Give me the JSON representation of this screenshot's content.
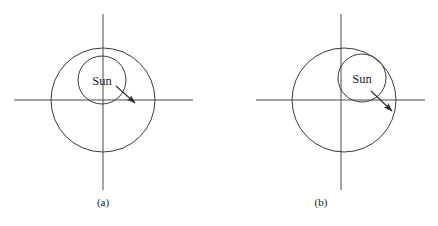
{
  "figure": {
    "background_color": "#ffffff",
    "stroke_color": "#3a3a3a",
    "text_color": "#1a1a1a",
    "panels": [
      {
        "id": "a",
        "caption": "(a)",
        "sun_label": "Sun",
        "axes": {
          "origin_x": 103,
          "origin_y": 100,
          "h_axis_x1": 14,
          "h_axis_x2": 193,
          "v_axis_y1": 14,
          "v_axis_y2": 190
        },
        "orbit_circle": {
          "cx": 103,
          "cy": 100,
          "r": 52
        },
        "sun_circle": {
          "cx": 102,
          "cy": 80,
          "r": 24
        },
        "arrow": {
          "x1": 116,
          "y1": 86,
          "x2": 137,
          "y2": 105
        }
      },
      {
        "id": "b",
        "caption": "(b)",
        "sun_label": "Sun",
        "axes": {
          "origin_x": 341,
          "origin_y": 100,
          "h_axis_x1": 256,
          "h_axis_x2": 425,
          "v_axis_y1": 14,
          "v_axis_y2": 190
        },
        "orbit_circle": {
          "cx": 344,
          "cy": 100,
          "r": 52
        },
        "sun_circle": {
          "cx": 362,
          "cy": 78,
          "r": 24
        },
        "arrow": {
          "x1": 371,
          "y1": 91,
          "x2": 394,
          "y2": 113
        }
      }
    ]
  }
}
